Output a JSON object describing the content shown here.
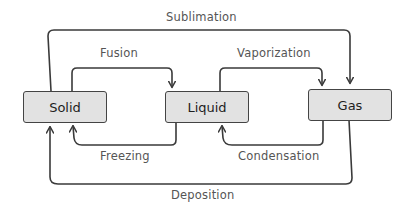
{
  "diagram": {
    "colors": {
      "box_fill": "#e2e2e2",
      "stroke": "#3a3a3a",
      "label_text": "#555555",
      "box_text": "#1e1e1e"
    },
    "nodes": [
      {
        "id": "solid",
        "label": "Solid"
      },
      {
        "id": "liquid",
        "label": "Liquid"
      },
      {
        "id": "gas",
        "label": "Gas"
      }
    ],
    "edges": {
      "sublimation": {
        "label": "Sublimation",
        "from": "solid",
        "to": "gas"
      },
      "fusion": {
        "label": "Fusion",
        "from": "solid",
        "to": "liquid"
      },
      "vaporization": {
        "label": "Vaporization",
        "from": "liquid",
        "to": "gas"
      },
      "freezing": {
        "label": "Freezing",
        "from": "liquid",
        "to": "solid"
      },
      "condensation": {
        "label": "Condensation",
        "from": "gas",
        "to": "liquid"
      },
      "deposition": {
        "label": "Deposition",
        "from": "gas",
        "to": "solid"
      }
    }
  }
}
